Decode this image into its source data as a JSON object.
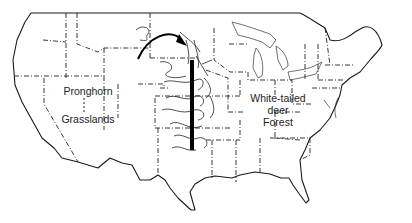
{
  "map": {
    "region": "Contiguous United States",
    "labels": {
      "west": [
        "Pronghorn",
        "Grasslands"
      ],
      "east": [
        "White-tailed",
        "deer",
        "Forest"
      ]
    },
    "west_separator": ":",
    "features": {
      "boundary_bar": "thick vertical line through Great Plains",
      "arrow": "curved arrow pointing east over northern plains",
      "drainage": "wavy river tributaries along boundary"
    },
    "colors": {
      "ink": "#1a1a1a",
      "background": "#ffffff"
    }
  }
}
